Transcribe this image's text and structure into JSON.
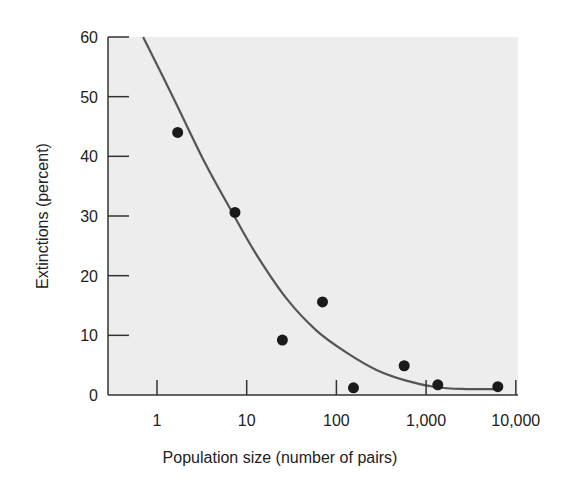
{
  "chart_data": {
    "type": "scatter",
    "title": "",
    "xlabel": "Population size (number of pairs)",
    "ylabel": "Extinctions (percent)",
    "xscale": "log",
    "xlim": [
      0.3,
      10000
    ],
    "ylim": [
      0,
      60
    ],
    "x_ticks": [
      1,
      10,
      100,
      1000,
      10000
    ],
    "x_tick_labels": [
      "1",
      "10",
      "100",
      "1,000",
      "10,000"
    ],
    "y_ticks": [
      0,
      10,
      20,
      30,
      40,
      50,
      60
    ],
    "y_tick_labels": [
      "0",
      "10",
      "20",
      "30",
      "40",
      "50",
      "60"
    ],
    "grid": false,
    "legend": null,
    "series": [
      {
        "name": "observed",
        "kind": "scatter",
        "points": [
          {
            "x": 1.7,
            "y": 44
          },
          {
            "x": 7.4,
            "y": 30.6
          },
          {
            "x": 25,
            "y": 9.2
          },
          {
            "x": 70,
            "y": 15.6
          },
          {
            "x": 155,
            "y": 1.2
          },
          {
            "x": 570,
            "y": 4.9
          },
          {
            "x": 1350,
            "y": 1.7
          },
          {
            "x": 6300,
            "y": 1.4
          }
        ]
      },
      {
        "name": "fitted curve",
        "kind": "line",
        "points": [
          {
            "x": 0.7,
            "y": 60
          },
          {
            "x": 1.5,
            "y": 50
          },
          {
            "x": 3.4,
            "y": 39
          },
          {
            "x": 6.9,
            "y": 30.6
          },
          {
            "x": 13,
            "y": 23.4
          },
          {
            "x": 28,
            "y": 16.1
          },
          {
            "x": 60,
            "y": 10.8
          },
          {
            "x": 130,
            "y": 7.1
          },
          {
            "x": 280,
            "y": 4.2
          },
          {
            "x": 600,
            "y": 2.4
          },
          {
            "x": 1300,
            "y": 1.3
          },
          {
            "x": 2800,
            "y": 1.0
          },
          {
            "x": 6000,
            "y": 1.0
          }
        ]
      }
    ]
  },
  "colors": {
    "panel": "#ededed",
    "axis": "#333333",
    "curve": "#555555",
    "point": "#1a1a1a"
  }
}
